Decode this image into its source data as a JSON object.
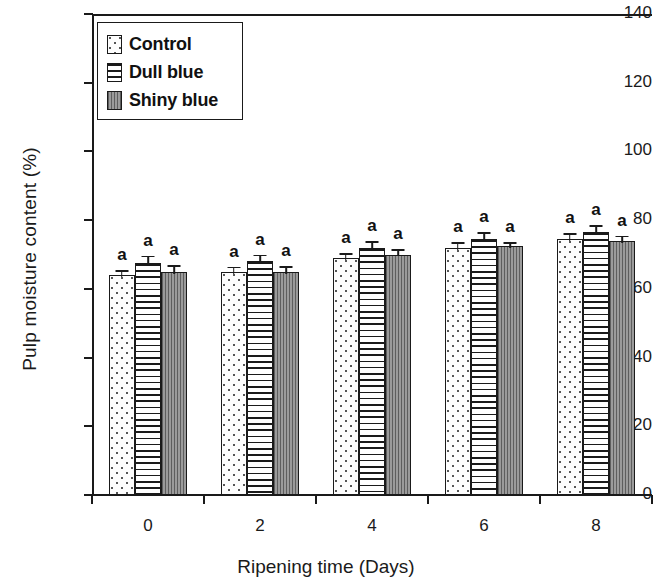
{
  "chart_data": {
    "type": "bar",
    "title": "",
    "xlabel": "Ripening time (Days)",
    "ylabel": "Pulp moisture content (%)",
    "categories": [
      "0",
      "2",
      "4",
      "6",
      "8"
    ],
    "ylim": [
      0,
      140
    ],
    "y_ticks": [
      0,
      20,
      40,
      60,
      80,
      100,
      120,
      140
    ],
    "x_ticks": [
      "0",
      "2",
      "4",
      "6",
      "8"
    ],
    "grid": false,
    "legend_position": "top-left",
    "series": [
      {
        "name": "Control",
        "pattern": "dotted",
        "values": [
          64.0,
          65.0,
          69.0,
          72.0,
          74.5
        ],
        "errors": [
          1.5,
          1.5,
          1.5,
          1.5,
          1.8
        ],
        "letters": [
          "a",
          "a",
          "a",
          "a",
          "a"
        ]
      },
      {
        "name": "Dull blue",
        "pattern": "horizontal-lines",
        "values": [
          67.5,
          68.0,
          72.0,
          74.5,
          76.5
        ],
        "errors": [
          2.2,
          2.0,
          2.0,
          2.0,
          2.0
        ],
        "letters": [
          "a",
          "a",
          "a",
          "a",
          "a"
        ]
      },
      {
        "name": "Shiny blue",
        "pattern": "gray-vertical-lines",
        "values": [
          65.0,
          65.0,
          70.0,
          72.5,
          74.0
        ],
        "errors": [
          2.0,
          1.6,
          1.6,
          1.0,
          1.5
        ],
        "letters": [
          "a",
          "a",
          "a",
          "a",
          "a"
        ]
      }
    ]
  },
  "legend": {
    "items": [
      {
        "label": "Control"
      },
      {
        "label": "Dull blue"
      },
      {
        "label": "Shiny blue"
      }
    ]
  },
  "axes": {
    "y_title": "Pulp moisture content (%)",
    "x_title": "Ripening time (Days)",
    "y_tick_labels": [
      "0",
      "20",
      "40",
      "60",
      "80",
      "100",
      "120",
      "140"
    ],
    "x_tick_labels": [
      "0",
      "2",
      "4",
      "6",
      "8"
    ]
  },
  "colors": {
    "axis": "#1a1a1a",
    "control_fill": "#fdfdfd",
    "dull_blue_fill": "#ffffff",
    "shiny_blue_fill": "#8e8e8e",
    "text": "#111111"
  }
}
